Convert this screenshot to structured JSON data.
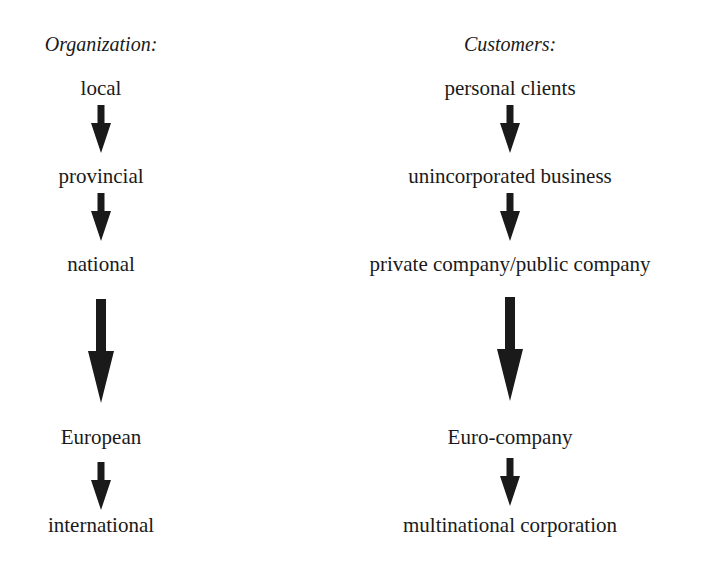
{
  "diagram": {
    "organization": {
      "header": "Organization:",
      "levels": [
        "local",
        "provincial",
        "national",
        "European",
        "international"
      ]
    },
    "customers": {
      "header": "Customers:",
      "levels": [
        "personal clients",
        "unincorporated business",
        "private company/public company",
        "Euro-company",
        "multinational corporation"
      ]
    },
    "arrow_color": "#1a1a1a",
    "emphasized_transition": "national → European / private company/public company → Euro-company"
  }
}
